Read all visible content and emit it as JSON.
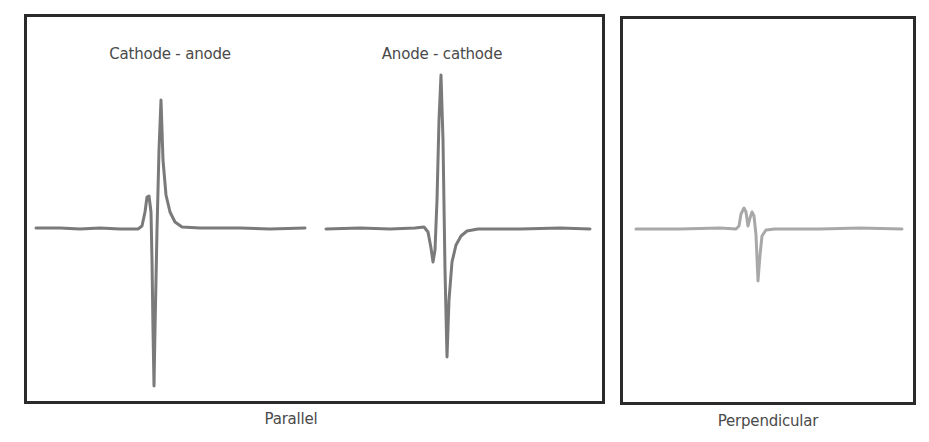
{
  "panels": {
    "parallel": {
      "caption": "Parallel",
      "traces": [
        {
          "label": "Cathode - anode"
        },
        {
          "label": "Anode - cathode"
        }
      ]
    },
    "perpendicular": {
      "caption": "Perpendicular"
    }
  },
  "colors": {
    "frame": "#2a2a2a",
    "trace_parallel": "#7a7a7a",
    "trace_perpendicular": "#a8a8a8",
    "text": "#4a4a4a"
  }
}
